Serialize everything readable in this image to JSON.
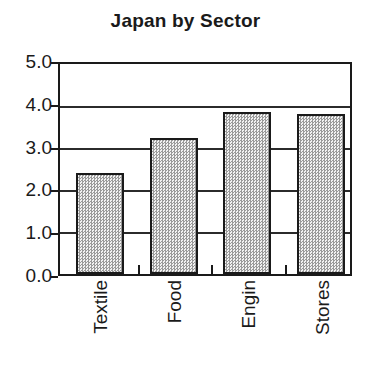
{
  "chart_data": {
    "type": "bar",
    "title": "Japan by Sector",
    "xlabel": "",
    "ylabel": "",
    "categories": [
      "Textile",
      "Food",
      "Engin",
      "Stores"
    ],
    "values": [
      2.4,
      3.25,
      3.85,
      3.8
    ],
    "ylim": [
      0.0,
      5.0
    ],
    "ytick_labels": [
      "5.0",
      "4.0",
      "3.0",
      "2.0",
      "1.0",
      "0.0"
    ],
    "ytick_values": [
      5.0,
      4.0,
      3.0,
      2.0,
      1.0,
      0.0
    ],
    "ytick_step": 1.0,
    "grid": true,
    "grid_axis": "y",
    "legend": false,
    "legend_position": "none",
    "bar_fill_color": "#d8d8d8",
    "bar_edge_color": "#1a1a1a",
    "axis_color": "#1a1a1a",
    "background_color": "#ffffff",
    "xtick_label_rotation": 90
  }
}
